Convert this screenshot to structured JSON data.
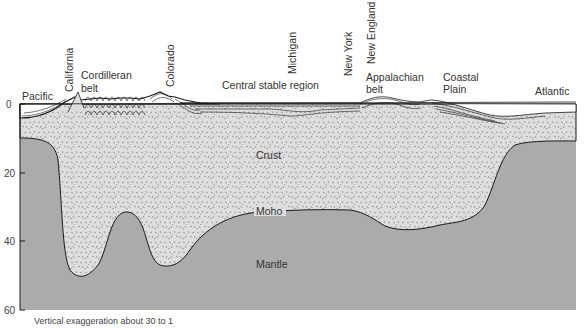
{
  "diagram": {
    "caption": "Vertical exaggeration about 30 to 1",
    "y_axis": {
      "ticks": [
        "0",
        "20",
        "40",
        "60"
      ]
    },
    "layers": {
      "crust": "Crust",
      "moho": "Moho",
      "mantle": "Mantle"
    },
    "regions": {
      "pacific": "Pacific",
      "california": "California",
      "cordilleran_line1": "Cordilleran",
      "cordilleran_line2": "belt",
      "colorado": "Colorado",
      "central": "Central stable region",
      "michigan": "Michigan",
      "new_york": "New York",
      "new_england": "New England",
      "appalachian_line1": "Appalachian",
      "appalachian_line2": "belt",
      "coastal_line1": "Coastal",
      "coastal_line2": "Plain",
      "atlantic": "Atlantic"
    },
    "colors": {
      "mantle": "#a9a9a9",
      "crust": "#dcdcdc",
      "sediment": "#ffffff",
      "line": "#1a1a1a"
    }
  }
}
